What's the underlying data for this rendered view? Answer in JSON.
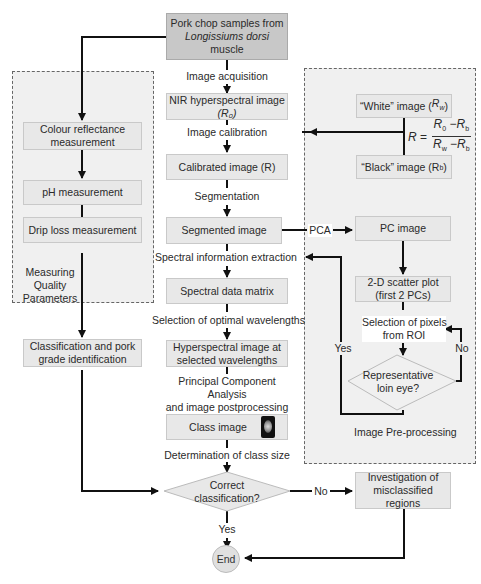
{
  "title_box": {
    "line1": "Pork chop samples from",
    "line2": "Longissiums dorsi",
    "line3": "muscle"
  },
  "center_flow": {
    "image_acquisition": "Image acquisition",
    "nir_image": {
      "line1": "NIR hyperspectral image",
      "line2": "(R₀)"
    },
    "image_calibration": "Image calibration",
    "calibrated_image": "Calibrated image (R)",
    "segmentation": "Segmentation",
    "segmented_image": "Segmented image",
    "spectral_info_extraction": "Spectral information extraction",
    "spectral_data_matrix": "Spectral data matrix",
    "selection_optimal_wavelengths": "Selection of optimal wavelengths",
    "hyperspectral_selected": {
      "line1": "Hyperspectral image at",
      "line2": "selected wavelengths"
    },
    "pca_postprocessing": {
      "line1": "Principal Component Analysis",
      "line2": "and image postprocessing"
    },
    "class_image": "Class image",
    "determination_class_size": "Determination of class size",
    "correct_classification": {
      "line1": "Correct",
      "line2": "classification?"
    },
    "yes": "Yes",
    "no": "No",
    "end": "End"
  },
  "left_panel": {
    "title": {
      "line1": "Measuring",
      "line2": "Quality",
      "line3": "Parameters"
    },
    "colour_reflectance": {
      "line1": "Colour reflectance",
      "line2": "measurement"
    },
    "ph_measurement": "pH measurement",
    "drip_loss": "Drip loss measurement",
    "classification_grade": {
      "line1": "Classification and pork",
      "line2": "grade identification"
    }
  },
  "right_panel": {
    "title": "Image Pre-processing",
    "white_image": "“White” image (Rᵥᵥ)",
    "white_image_text": "“White” image (",
    "white_sub": "w",
    "black_image_text": "“Black” image (R",
    "black_sub": "b",
    "formula": {
      "lhs": "R =",
      "numerator": "R₀ − Rᵦ",
      "numerator_text": "R0 − Rb",
      "denominator_text": "Rw − Rb"
    },
    "pca_label": "PCA",
    "pc_image": "PC image",
    "scatter_plot": {
      "line1": "2-D scatter plot",
      "line2": "(first 2 PCs)"
    },
    "selection_pixels": {
      "line1": "Selection of pixels",
      "line2": "from ROI"
    },
    "representative": {
      "line1": "Representative",
      "line2": "loin eye?"
    },
    "yes": "Yes",
    "no": "No"
  },
  "investigation": {
    "line1": "Investigation of",
    "line2": "misclassified",
    "line3": "regions"
  }
}
